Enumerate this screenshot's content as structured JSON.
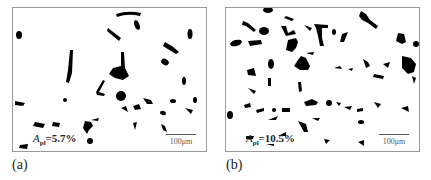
{
  "panels": [
    {
      "id": "a",
      "caption": "(a)",
      "area_symbol": "A",
      "area_subscript": "pl",
      "area_value": "=5.7%",
      "scale_label": "100μm"
    },
    {
      "id": "b",
      "caption": "(b)",
      "area_symbol": "A",
      "area_subscript": "pl",
      "area_value": "=10.5%",
      "scale_label": "100μm"
    }
  ],
  "colors": {
    "particle": "#000000",
    "border": "#9a9a9a",
    "background": "#ffffff"
  }
}
